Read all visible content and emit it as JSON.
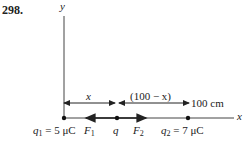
{
  "problem_number": "298.",
  "axes": {
    "y_label": "y",
    "x_label": "x"
  },
  "dimensions": {
    "segment_1_label": "x",
    "segment_2_label": "(100 − x)",
    "total_label": "100 cm"
  },
  "charges": [
    {
      "name": "q1",
      "symbol": "q",
      "subscript": "1",
      "value": "= 5 μC"
    },
    {
      "name": "q",
      "symbol": "q"
    },
    {
      "name": "q2",
      "symbol": "q",
      "subscript": "2",
      "value": "= 7 μC"
    }
  ],
  "forces": [
    {
      "symbol": "F",
      "subscript": "1",
      "direction": "left"
    },
    {
      "symbol": "F",
      "subscript": "2",
      "direction": "right"
    }
  ],
  "colors": {
    "line": "#333333",
    "background": "#ffffff"
  }
}
